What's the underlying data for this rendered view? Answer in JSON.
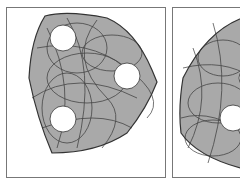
{
  "figure": {
    "panels": [
      {
        "id": "panel-1",
        "shape": "rounded-triangle",
        "holes": 3
      },
      {
        "id": "panel-2",
        "shape": "rounded-blob (cropped)",
        "holes": 2
      }
    ],
    "colors": {
      "fill": "#a9a9a9",
      "stroke": "#333333",
      "hole": "#ffffff",
      "border": "#777777"
    }
  }
}
